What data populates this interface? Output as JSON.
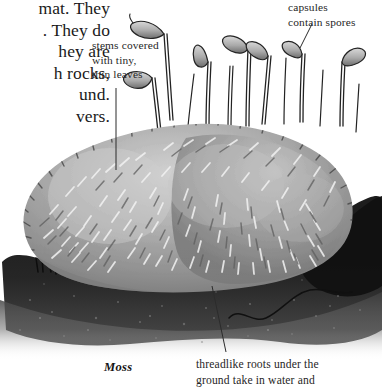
{
  "page": {
    "width": 382,
    "height": 389,
    "background": "#ffffff",
    "ink": "#1a1a1a"
  },
  "body_text": {
    "note": "paragraph clipped by the left page edge",
    "lines": [
      "mat. They",
      ". They do",
      "hey are",
      "h rocks,",
      "und.",
      "vers."
    ],
    "text": "mat. They\n. They do\nhey are\nh rocks,\nund.\nvers."
  },
  "callouts": [
    {
      "id": "stems",
      "text": "stems covered\nwith tiny,\nthin leaves",
      "leader": "vertical line dropping from label into the moss cushion"
    },
    {
      "id": "capsules",
      "text": "capsules\ncontain spores",
      "leader": "short diagonal line down-left to a capsule"
    },
    {
      "id": "roots",
      "text": "threadlike roots under the\nground take in water and",
      "leader": "diagonal line up-left into the dark soil"
    }
  ],
  "caption": {
    "label": "Moss"
  },
  "illustration": {
    "name": "moss-illustration",
    "subject": "moss cushion with sporophytes on dark soil",
    "style": "grayscale pen-and-ink / stipple botanical drawing",
    "colors": {
      "moss_mid": "#9a9a9a",
      "moss_light": "#c9c9c9",
      "moss_highlight": "#efefef",
      "moss_shadow": "#6f6f6f",
      "soil_dark": "#141414",
      "soil_mid": "#3a3a3a",
      "stalk": "#2a2a2a",
      "capsule_fill": "#b4b4b4"
    },
    "parts": [
      "moss cushion mound",
      "hair-like leaf strokes",
      "sporophyte stalks (setae)",
      "spore capsules",
      "dark soil layer",
      "rhizoid root filament"
    ]
  }
}
